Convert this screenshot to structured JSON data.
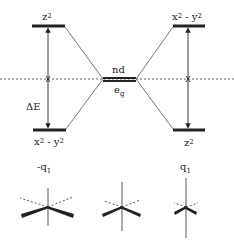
{
  "diagram": {
    "type": "energy level / orbital splitting diagram",
    "center_level": {
      "label_top": "nd",
      "label_bottom": "e",
      "label_bottom_sub": "g"
    },
    "left_column": {
      "top_level": {
        "label": "z",
        "sup": "2"
      },
      "bottom_level": {
        "label": "x",
        "sup1": "2",
        "mid": " - y",
        "sup2": "2"
      },
      "gap_label": "ΔE",
      "distortion_label": "-q",
      "distortion_sub": "1"
    },
    "right_column": {
      "top_level": {
        "label": "x",
        "sup1": "2",
        "mid": " - y",
        "sup2": "2"
      },
      "bottom_level": {
        "label": "z",
        "sup": "2"
      },
      "distortion_label": "q",
      "distortion_sub": "1"
    },
    "molecules": [
      {
        "name": "compressed-octahedron",
        "position": "left"
      },
      {
        "name": "regular-octahedron",
        "position": "center"
      },
      {
        "name": "elongated-octahedron",
        "position": "right"
      }
    ],
    "colors": {
      "line": "#222222",
      "thin_line": "#555555"
    }
  }
}
